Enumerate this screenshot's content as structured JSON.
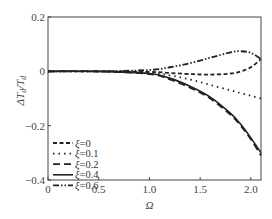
{
  "chart_data": {
    "type": "line",
    "title": "",
    "xlabel": "Ω",
    "ylabel": "ΔT_d/T_d",
    "xlim": [
      0,
      2.1
    ],
    "ylim": [
      -0.4,
      0.2
    ],
    "xticks": [
      "0",
      "0.5",
      "1.0",
      "1.5",
      "2.0"
    ],
    "yticks": [
      "0.2",
      "0",
      "-0.2",
      "-0.4"
    ],
    "grid": false,
    "legend_position": "lower left",
    "x": [
      0,
      0.5,
      1.0,
      1.2,
      1.4,
      1.6,
      1.8,
      1.9,
      2.0,
      2.1
    ],
    "series": [
      {
        "name": "ξ=0",
        "style": "dashed",
        "values": [
          0,
          0,
          -0.002,
          -0.006,
          -0.01,
          -0.012,
          -0.008,
          0.0,
          0.015,
          0.045
        ]
      },
      {
        "name": "ξ=0.1",
        "style": "dotted",
        "values": [
          0,
          0,
          -0.005,
          -0.015,
          -0.03,
          -0.05,
          -0.07,
          -0.08,
          -0.09,
          -0.1
        ]
      },
      {
        "name": "ξ=0.2",
        "style": "dash-gap",
        "values": [
          0,
          0,
          -0.01,
          -0.03,
          -0.06,
          -0.1,
          -0.16,
          -0.2,
          -0.25,
          -0.31
        ]
      },
      {
        "name": "ξ=0.4",
        "style": "solid",
        "values": [
          0,
          0,
          -0.008,
          -0.025,
          -0.055,
          -0.095,
          -0.155,
          -0.195,
          -0.245,
          -0.3
        ]
      },
      {
        "name": "ξ=0.6",
        "style": "dash-dot-dot",
        "values": [
          0,
          0,
          0.005,
          0.015,
          0.03,
          0.05,
          0.07,
          0.074,
          0.068,
          0.045
        ]
      }
    ]
  },
  "legend": [
    "ξ=0",
    "ξ=0.1",
    "ξ=0.2",
    "ξ=0.4",
    "ξ=0.6"
  ],
  "axes": {
    "xlabel": "Ω",
    "ylabel": "ΔTd/Td"
  }
}
